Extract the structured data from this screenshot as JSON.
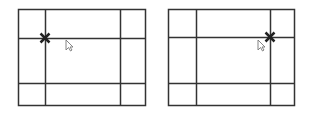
{
  "figure": {
    "colors": {
      "line": "#333333",
      "marker": "#222222",
      "background": "#ffffff",
      "cursor_fill": "#ffffff",
      "cursor_stroke": "#777777"
    },
    "panels": [
      {
        "name": "left-panel",
        "box": {
          "x": 18,
          "y": 9,
          "w": 127,
          "h": 96
        },
        "vlines": [
          45,
          120
        ],
        "hlines": [
          38,
          83
        ],
        "marker": {
          "x": 45,
          "y": 38
        },
        "cursor": {
          "x": 66,
          "y": 40
        }
      },
      {
        "name": "right-panel",
        "box": {
          "x": 168,
          "y": 9,
          "w": 126,
          "h": 96
        },
        "vlines": [
          196,
          270
        ],
        "hlines": [
          37,
          83
        ],
        "marker": {
          "x": 270,
          "y": 37
        },
        "cursor": {
          "x": 258,
          "y": 40
        }
      }
    ]
  }
}
